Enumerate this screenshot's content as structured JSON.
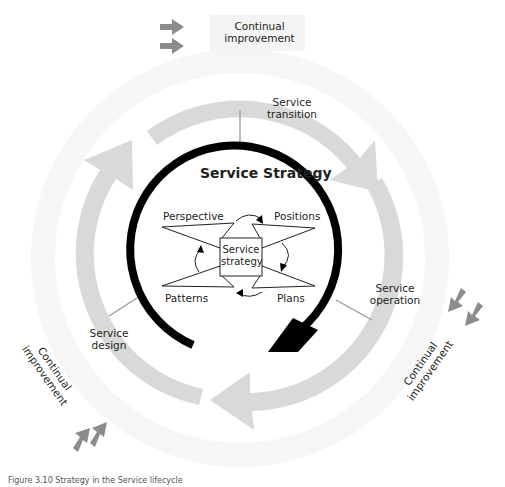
{
  "figure": {
    "title": "Service Strategy",
    "center_box": "Service strategy",
    "caption": "Figure 3.10  Strategy in the Service lifecycle"
  },
  "strategy_elements": {
    "perspective": "Perspective",
    "positions": "Positions",
    "patterns": "Patterns",
    "plans": "Plans"
  },
  "lifecycle_stages": {
    "transition": "Service transition",
    "transition_l1": "Service",
    "transition_l2": "transition",
    "operation_l1": "Service",
    "operation_l2": "operation",
    "design_l1": "Service",
    "design_l2": "design"
  },
  "continual_improvement": {
    "top_l1": "Continual",
    "top_l2": "improvement",
    "right_l1": "Continual",
    "right_l2": "improvement",
    "left_l1": "Continual",
    "left_l2": "improvement"
  },
  "colors": {
    "strategy_ring": "#000000",
    "lifecycle_ring": "#d9d9d9",
    "improvement_ring": "#f5f5f5",
    "improvement_arrows": "#8c8c8c",
    "connector": "#9a9a9a"
  }
}
